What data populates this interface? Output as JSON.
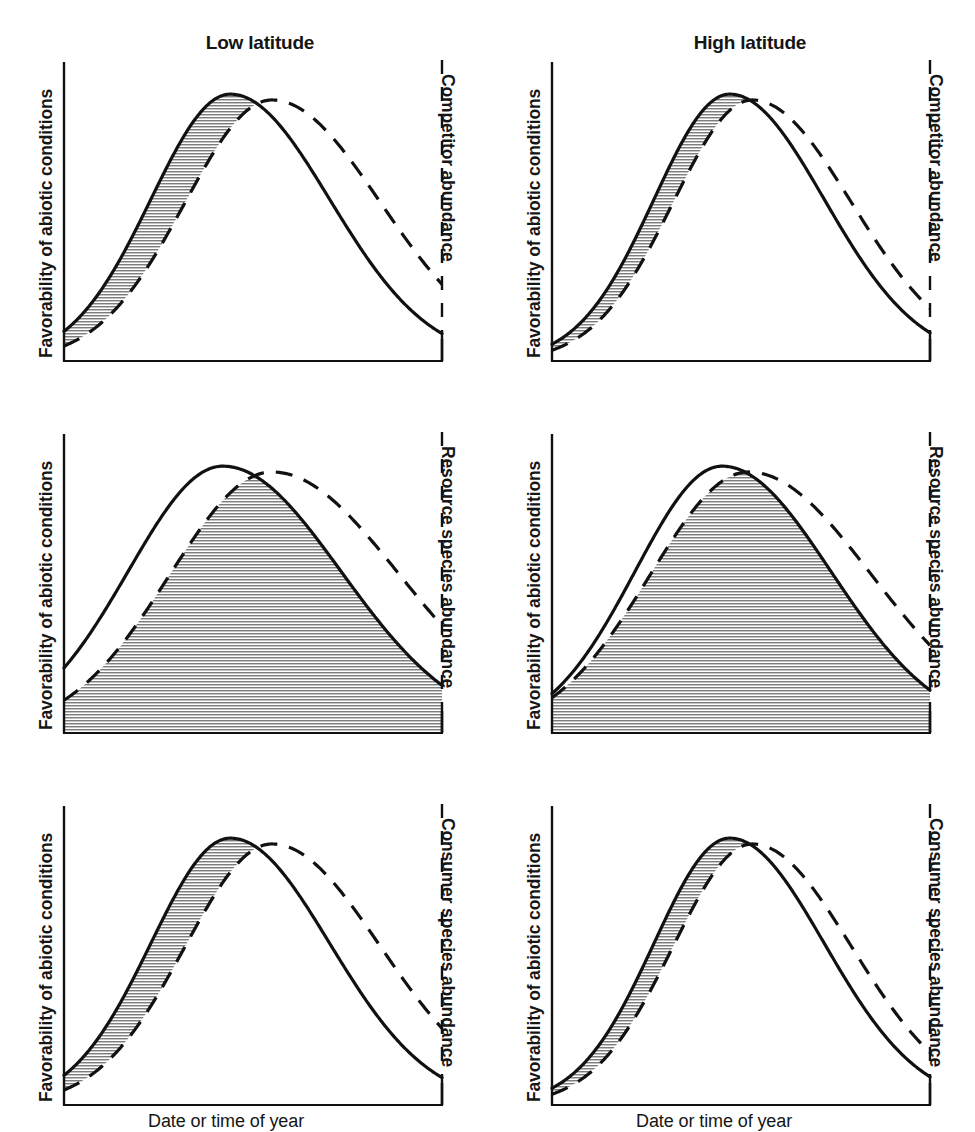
{
  "figure": {
    "columns": [
      {
        "key": "low",
        "title": "Low latitude"
      },
      {
        "key": "high",
        "title": "High latitude"
      }
    ],
    "xlabel": "Date or time of year",
    "ylabel_left": "Favorability of abiotic conditions",
    "rows": [
      {
        "key": "competitor",
        "ylabel_right": "Competitor abundance"
      },
      {
        "key": "resource",
        "ylabel_right": "Resource species abundance"
      },
      {
        "key": "consumer",
        "ylabel_right": "Consumer species abundance"
      }
    ],
    "line_color": "#111111",
    "hatch_color": "#7d7d7d",
    "background": "#ffffff"
  },
  "chart_data": {
    "type": "line",
    "title": "",
    "xlabel": "Date or time of year",
    "ylabel": "Favorability of abiotic conditions",
    "ylabel_secondary": "Species abundance",
    "grid": false,
    "legend": "none",
    "xlim": [
      0,
      100
    ],
    "ylim": [
      0,
      100
    ],
    "axis_note": "Left axis solid, right axis drawn as dashed line matching the dashed curve",
    "series_styles": [
      {
        "name": "Favorability of abiotic conditions",
        "style": "solid",
        "axis": "left"
      },
      {
        "name": "Species abundance",
        "style": "dashed",
        "axis": "right"
      }
    ],
    "panels": [
      {
        "row": "competitor",
        "column": "low",
        "row_label": "Competitor abundance",
        "column_label": "Low latitude",
        "shading": "gap-on-rising-limb",
        "shading_meaning": "Mismatch between abiotic favorability and competitor abundance",
        "solid": {
          "peak_x": 44,
          "peak_y": 92,
          "width": 21
        },
        "dashed": {
          "peak_x": 55,
          "peak_y": 90,
          "width": 23
        },
        "lag": 11
      },
      {
        "row": "competitor",
        "column": "high",
        "row_label": "Competitor abundance",
        "column_label": "High latitude",
        "shading": "gap-on-rising-limb",
        "shading_meaning": "Mismatch between abiotic favorability and competitor abundance",
        "solid": {
          "peak_x": 47,
          "peak_y": 92,
          "width": 20
        },
        "dashed": {
          "peak_x": 53,
          "peak_y": 90,
          "width": 21
        },
        "lag": 6
      },
      {
        "row": "resource",
        "column": "low",
        "row_label": "Resource species abundance",
        "column_label": "Low latitude",
        "shading": "overlap-intersection",
        "shading_meaning": "Overlap of abiotic favorability and resource species abundance",
        "solid": {
          "peak_x": 42,
          "peak_y": 92,
          "width": 25
        },
        "dashed": {
          "peak_x": 55,
          "peak_y": 90,
          "width": 27
        },
        "lag": 13
      },
      {
        "row": "resource",
        "column": "high",
        "row_label": "Resource species abundance",
        "column_label": "High latitude",
        "shading": "overlap-intersection",
        "shading_meaning": "Overlap of abiotic favorability and resource species abundance",
        "solid": {
          "peak_x": 45,
          "peak_y": 92,
          "width": 23
        },
        "dashed": {
          "peak_x": 52,
          "peak_y": 90,
          "width": 26
        },
        "lag": 7
      },
      {
        "row": "consumer",
        "column": "low",
        "row_label": "Consumer species abundance",
        "column_label": "Low latitude",
        "shading": "gap-on-rising-limb",
        "shading_meaning": "Mismatch between abiotic favorability and consumer species abundance",
        "solid": {
          "peak_x": 44,
          "peak_y": 92,
          "width": 21
        },
        "dashed": {
          "peak_x": 55,
          "peak_y": 90,
          "width": 23
        },
        "lag": 11
      },
      {
        "row": "consumer",
        "column": "high",
        "row_label": "Consumer species abundance",
        "column_label": "High latitude",
        "shading": "gap-on-rising-limb",
        "shading_meaning": "Mismatch between abiotic favorability and consumer species abundance",
        "solid": {
          "peak_x": 47,
          "peak_y": 92,
          "width": 20
        },
        "dashed": {
          "peak_x": 53,
          "peak_y": 90,
          "width": 21
        },
        "lag": 6
      }
    ]
  }
}
